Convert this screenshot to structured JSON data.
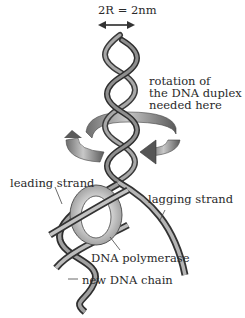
{
  "diagram": {
    "width_label": "2R = 2nm",
    "rotation_label": [
      "rotation of",
      "the DNA duplex",
      "needed here"
    ],
    "labels": {
      "leading_strand": "leading strand",
      "lagging_strand": "lagging strand",
      "dna_polymerase": "DNA polymerase",
      "new_dna_chain": "new DNA chain"
    },
    "colors": {
      "strand_dark": "#3c3c3c",
      "strand_mid": "#7a7a7a",
      "strand_light": "#bdbdbd",
      "polymerase_ring": "#a9a9a9",
      "background": "#ffffff",
      "text": "#2a2a2a"
    }
  }
}
